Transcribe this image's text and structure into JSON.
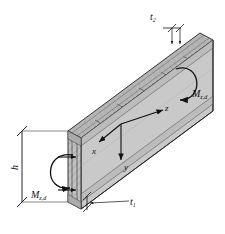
{
  "figure": {
    "type": "isometric-engineering-diagram",
    "background_color": "#ffffff",
    "line_color": "#111111",
    "face_colors": {
      "front": "#c8c8c8",
      "top": "#b4b4b4",
      "end": "#bdbdbd",
      "core": "#d6d6d6",
      "dark_edge": "#8a8a8a"
    }
  },
  "labels": {
    "thickness_top": {
      "symbol": "t",
      "subscript": "2"
    },
    "thickness_bottom": {
      "symbol": "t",
      "subscript": "1"
    },
    "height": {
      "symbol": "h",
      "subscript": ""
    },
    "moment_right": {
      "symbol": "M",
      "subscript": "z,d"
    },
    "moment_left": {
      "symbol": "M",
      "subscript": "z,d"
    }
  },
  "axes": {
    "x": "x",
    "y": "y",
    "z": "z"
  }
}
